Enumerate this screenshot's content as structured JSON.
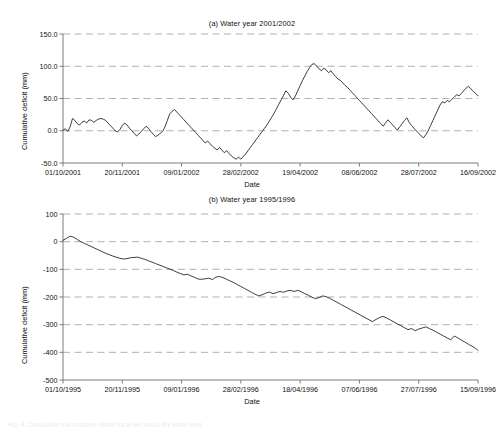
{
  "figure": {
    "caption": "Fig. 4. Cumulative soil moisture deficit for a wet and a dry water year."
  },
  "chart_data": [
    {
      "id": "panel-a",
      "type": "line",
      "title": "(a) Water year 2001/2002",
      "xlabel": "Date",
      "ylabel": "Cumulative deficit (mm)",
      "ylim": [
        -50,
        150
      ],
      "yticks": [
        -50,
        0,
        50,
        100,
        150
      ],
      "ytick_labels": [
        "-50.0",
        "0.0",
        "50.0",
        "100.0",
        "150.0"
      ],
      "xlim": [
        0,
        350
      ],
      "xticks": [
        0,
        50,
        100,
        150,
        200,
        250,
        300,
        350
      ],
      "xtick_labels": [
        "01/10/2001",
        "20/11/2001",
        "09/01/2002",
        "28/02/2002",
        "19/04/2002",
        "08/06/2002",
        "28/07/2002",
        "16/09/2002"
      ],
      "grid": true,
      "legend": "none",
      "series": [
        {
          "name": "Cumulative deficit 2001/2002",
          "x": [
            0,
            2,
            4,
            6,
            8,
            10,
            12,
            14,
            16,
            18,
            20,
            22,
            24,
            26,
            28,
            30,
            32,
            34,
            36,
            38,
            40,
            42,
            44,
            46,
            48,
            50,
            52,
            54,
            56,
            58,
            60,
            62,
            64,
            66,
            68,
            70,
            72,
            74,
            76,
            78,
            80,
            82,
            84,
            86,
            88,
            90,
            92,
            94,
            96,
            98,
            100,
            102,
            104,
            106,
            108,
            110,
            112,
            114,
            116,
            118,
            120,
            122,
            124,
            126,
            128,
            130,
            132,
            134,
            136,
            138,
            140,
            142,
            144,
            146,
            148,
            150,
            152,
            154,
            156,
            158,
            160,
            162,
            164,
            166,
            168,
            170,
            172,
            174,
            176,
            178,
            180,
            182,
            184,
            186,
            188,
            190,
            192,
            194,
            196,
            198,
            200,
            202,
            204,
            206,
            208,
            210,
            212,
            214,
            216,
            218,
            220,
            222,
            224,
            226,
            228,
            230,
            232,
            234,
            236,
            238,
            240,
            242,
            244,
            246,
            248,
            250,
            252,
            254,
            256,
            258,
            260,
            262,
            264,
            266,
            268,
            270,
            272,
            274,
            276,
            278,
            280,
            282,
            284,
            286,
            288,
            290,
            292,
            294,
            296,
            298,
            300,
            302,
            304,
            306,
            308,
            310,
            312,
            314,
            316,
            318,
            320,
            322,
            324,
            326,
            328,
            330,
            332,
            334,
            336,
            338,
            340,
            342,
            344,
            346,
            348,
            350
          ],
          "values": [
            1,
            3,
            -1,
            6,
            19,
            16,
            11,
            9,
            13,
            15,
            12,
            17,
            16,
            13,
            16,
            18,
            19,
            18,
            16,
            12,
            8,
            4,
            0,
            -2,
            2,
            8,
            12,
            9,
            4,
            0,
            -4,
            -8,
            -5,
            -1,
            3,
            7,
            4,
            -1,
            -5,
            -9,
            -7,
            -4,
            -1,
            6,
            16,
            26,
            30,
            33,
            29,
            25,
            21,
            17,
            13,
            9,
            5,
            1,
            -3,
            -7,
            -11,
            -15,
            -19,
            -16,
            -20,
            -24,
            -27,
            -30,
            -26,
            -30,
            -34,
            -31,
            -35,
            -39,
            -42,
            -44,
            -41,
            -44,
            -40,
            -36,
            -31,
            -26,
            -21,
            -16,
            -11,
            -6,
            -1,
            4,
            9,
            15,
            21,
            27,
            34,
            41,
            48,
            55,
            62,
            58,
            52,
            48,
            54,
            62,
            70,
            78,
            85,
            92,
            98,
            103,
            104,
            100,
            96,
            93,
            97,
            94,
            90,
            93,
            88,
            84,
            80,
            78,
            74,
            70,
            67,
            63,
            59,
            55,
            51,
            47,
            43,
            39,
            35,
            31,
            27,
            23,
            19,
            15,
            11,
            7,
            12,
            17,
            13,
            9,
            5,
            1,
            6,
            11,
            16,
            20,
            13,
            8,
            4,
            0,
            -4,
            -8,
            -11,
            -6,
            0,
            8,
            16,
            24,
            32,
            40,
            45,
            43,
            47,
            45,
            49,
            52,
            56,
            54,
            58,
            62,
            66,
            69,
            65,
            61,
            58,
            54,
            50,
            53,
            50,
            46,
            42,
            45,
            43,
            39,
            35,
            31,
            34,
            31,
            27,
            33,
            38,
            30,
            25,
            27,
            22,
            18,
            21,
            28,
            35,
            42,
            52,
            62,
            70,
            68,
            64,
            66,
            70,
            67,
            63,
            60,
            64,
            61,
            57,
            53,
            49,
            45,
            41,
            37,
            33,
            29,
            25,
            21,
            17,
            13,
            22,
            31,
            40,
            45,
            40,
            34,
            28,
            22,
            16,
            10,
            4,
            -2,
            -8,
            -14,
            -17
          ]
        }
      ]
    },
    {
      "id": "panel-b",
      "type": "line",
      "title": "(b) Water year 1995/1996",
      "xlabel": "Date",
      "ylabel": "Cumulative deficit (mm)",
      "ylim": [
        -500,
        100
      ],
      "yticks": [
        -500,
        -400,
        -300,
        -200,
        -100,
        0,
        100
      ],
      "ytick_labels": [
        "-500",
        "-400",
        "-300",
        "-200",
        "-100",
        "0",
        "100"
      ],
      "xlim": [
        0,
        350
      ],
      "xticks": [
        0,
        50,
        100,
        150,
        200,
        250,
        300,
        350
      ],
      "xtick_labels": [
        "01/10/1995",
        "20/11/1995",
        "09/01/1996",
        "28/02/1996",
        "18/04/1996",
        "07/06/1996",
        "27/07/1996",
        "15/09/1996"
      ],
      "grid": true,
      "legend": "none",
      "series": [
        {
          "name": "Cumulative deficit 1995/1996",
          "x": [
            0,
            3,
            6,
            9,
            12,
            15,
            18,
            21,
            24,
            27,
            30,
            33,
            36,
            39,
            42,
            45,
            48,
            51,
            54,
            57,
            60,
            63,
            66,
            69,
            72,
            75,
            78,
            81,
            84,
            87,
            90,
            93,
            96,
            99,
            102,
            105,
            108,
            111,
            114,
            117,
            120,
            123,
            126,
            129,
            132,
            135,
            138,
            141,
            144,
            147,
            150,
            153,
            156,
            159,
            162,
            165,
            168,
            171,
            174,
            177,
            180,
            183,
            186,
            189,
            192,
            195,
            198,
            201,
            204,
            207,
            210,
            213,
            216,
            219,
            222,
            225,
            228,
            231,
            234,
            237,
            240,
            243,
            246,
            249,
            252,
            255,
            258,
            261,
            264,
            267,
            270,
            273,
            276,
            279,
            282,
            285,
            288,
            291,
            294,
            297,
            300,
            303,
            306,
            309,
            312,
            315,
            318,
            321,
            324,
            327,
            330,
            333,
            336,
            339,
            342,
            345,
            348,
            350
          ],
          "values": [
            5,
            12,
            20,
            16,
            8,
            0,
            -6,
            -12,
            -18,
            -24,
            -30,
            -36,
            -42,
            -47,
            -52,
            -56,
            -60,
            -63,
            -61,
            -58,
            -57,
            -56,
            -60,
            -64,
            -69,
            -74,
            -79,
            -84,
            -89,
            -94,
            -99,
            -104,
            -110,
            -115,
            -120,
            -118,
            -124,
            -129,
            -135,
            -136,
            -134,
            -132,
            -137,
            -128,
            -126,
            -130,
            -136,
            -142,
            -148,
            -155,
            -162,
            -169,
            -176,
            -183,
            -190,
            -196,
            -192,
            -186,
            -182,
            -188,
            -184,
            -180,
            -183,
            -178,
            -176,
            -180,
            -176,
            -181,
            -188,
            -194,
            -201,
            -206,
            -202,
            -196,
            -199,
            -205,
            -212,
            -219,
            -226,
            -233,
            -240,
            -247,
            -254,
            -261,
            -268,
            -275,
            -282,
            -289,
            -281,
            -274,
            -270,
            -276,
            -283,
            -290,
            -297,
            -304,
            -311,
            -318,
            -314,
            -322,
            -316,
            -312,
            -308,
            -314,
            -320,
            -327,
            -334,
            -341,
            -348,
            -355,
            -341,
            -348,
            -356,
            -363,
            -371,
            -378,
            -386,
            -393
          ]
        }
      ]
    }
  ]
}
